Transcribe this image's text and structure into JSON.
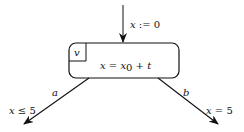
{
  "diagram": {
    "type": "hybrid-automaton",
    "initial_edge": {
      "label_var": "x",
      "label_op": " := ",
      "label_val": "0"
    },
    "location": {
      "name": "v",
      "flow_lhs": "x",
      "flow_eq": " = ",
      "flow_var": "x",
      "flow_sub": "0",
      "flow_rest": " + t"
    },
    "edges": [
      {
        "label": "a",
        "guard_var": "x",
        "guard_op": " ≤ ",
        "guard_val": "5"
      },
      {
        "label": "b",
        "guard_var": "x",
        "guard_op": " = ",
        "guard_val": "5"
      }
    ],
    "colors": {
      "stroke": "#111111",
      "background": "#ffffff"
    }
  }
}
